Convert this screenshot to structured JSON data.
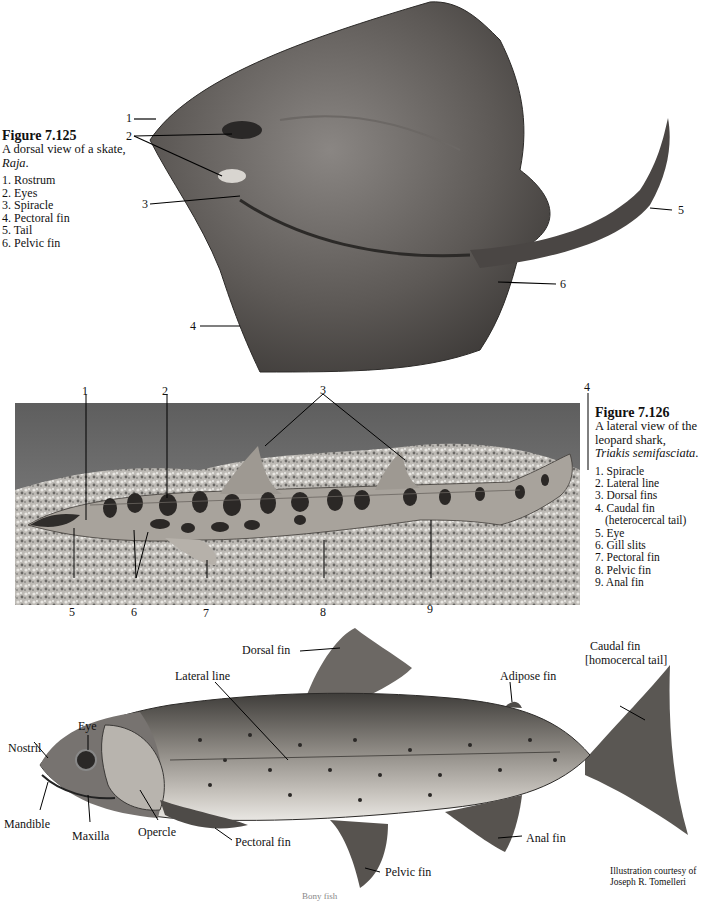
{
  "figure_125": {
    "number": "Figure 7.125",
    "caption_pre": "A dorsal view of a skate, ",
    "caption_italic": "Raja",
    "caption_post": ".",
    "legend": [
      "1. Rostrum",
      "2. Eyes",
      "3. Spiracle",
      "4. Pectoral fin",
      "5. Tail",
      "6. Pelvic fin"
    ],
    "callouts": [
      "1",
      "2",
      "3",
      "4",
      "5",
      "6"
    ]
  },
  "figure_126": {
    "number": "Figure 7.126",
    "caption_pre": "A lateral view of the leopard shark, ",
    "caption_italic": "Triakis semifasciata",
    "caption_post": ".",
    "legend": [
      "1. Spiracle",
      "2. Lateral line",
      "3. Dorsal fins",
      "4. Caudal fin",
      "(heterocercal tail)",
      "5. Eye",
      "6. Gill slits",
      "7. Pectoral fin",
      "8. Pelvic fin",
      "9. Anal fin"
    ],
    "callouts": [
      "1",
      "2",
      "3",
      "4",
      "5",
      "6",
      "7",
      "8",
      "9"
    ]
  },
  "trout": {
    "labels": {
      "dorsal_fin": "Dorsal fin",
      "lateral_line": "Lateral line",
      "adipose_fin": "Adipose fin",
      "caudal_fin_1": "Caudal fin",
      "caudal_fin_2": "[homocercal tail]",
      "eye": "Eye",
      "nostril": "Nostril",
      "mandible": "Mandible",
      "maxilla": "Maxilla",
      "opercle": "Opercle",
      "pectoral_fin": "Pectoral fin",
      "pelvic_fin": "Pelvic fin",
      "anal_fin": "Anal fin"
    },
    "credit_1": "Illustration courtesy of",
    "credit_2": "Joseph R. Tomelleri"
  },
  "footer": {
    "text": "Bony fish"
  }
}
